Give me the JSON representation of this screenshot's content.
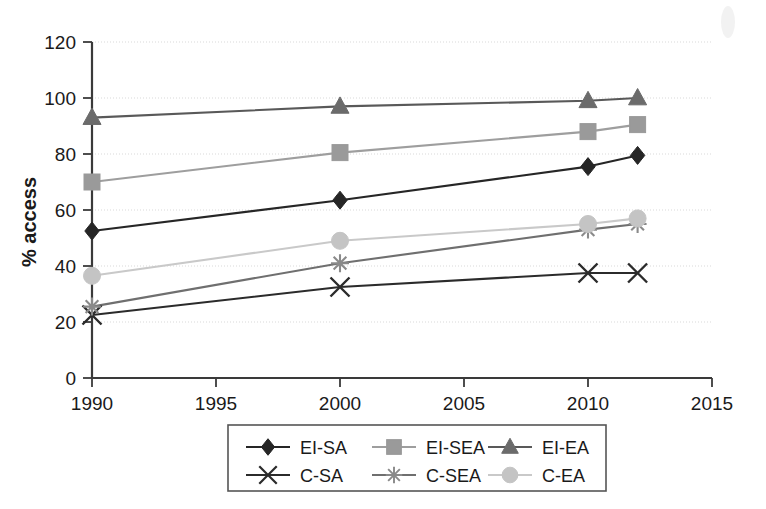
{
  "chart_data": {
    "type": "line",
    "title": "",
    "xlabel": "",
    "ylabel": "% access",
    "x": [
      1990,
      2000,
      2010,
      2012
    ],
    "xlim": [
      1990,
      2015
    ],
    "ylim": [
      0,
      120
    ],
    "xticks": [
      1990,
      1995,
      2000,
      2005,
      2010,
      2015
    ],
    "yticks": [
      0,
      20,
      40,
      60,
      80,
      100,
      120
    ],
    "xtick_labels": [
      "1990",
      "1995",
      "2000",
      "2005",
      "2010",
      "2015"
    ],
    "ytick_labels": [
      "0",
      "20",
      "40",
      "60",
      "80",
      "100",
      "120"
    ],
    "grid": true,
    "grid_axis": "y",
    "legend_position": "bottom-center",
    "legend_columns": 3,
    "series": [
      {
        "name": "EI-SA",
        "marker": "diamond",
        "color": "#262626",
        "line_color": "#262626",
        "values": [
          52.5,
          63.5,
          75.5,
          79.5
        ]
      },
      {
        "name": "EI-SEA",
        "marker": "square",
        "color": "#9a9a9a",
        "line_color": "#9e9e9e",
        "values": [
          70,
          80.5,
          88,
          90.5
        ]
      },
      {
        "name": "EI-EA",
        "marker": "triangle",
        "color": "#6b6b6b",
        "line_color": "#595959",
        "values": [
          93,
          97,
          99,
          100
        ]
      },
      {
        "name": "C-SA",
        "marker": "cross-x",
        "color": "#2b2b2b",
        "line_color": "#2b2b2b",
        "values": [
          22.5,
          32.5,
          37.5,
          37.5
        ]
      },
      {
        "name": "C-SEA",
        "marker": "asterisk",
        "color": "#8a8a8a",
        "line_color": "#6f6f6f",
        "values": [
          25.5,
          41,
          53,
          55
        ]
      },
      {
        "name": "C-EA",
        "marker": "circle",
        "color": "#c4c4c4",
        "line_color": "#c9c9c9",
        "values": [
          36.5,
          49,
          55,
          57
        ]
      }
    ]
  }
}
